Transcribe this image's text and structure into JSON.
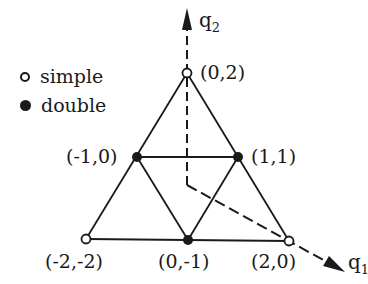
{
  "legend": {
    "items": [
      {
        "marker": "open-circle",
        "label": "simple"
      },
      {
        "marker": "filled-circle",
        "label": "double"
      }
    ]
  },
  "axes": {
    "q1": {
      "base": "q",
      "sub": "1"
    },
    "q2": {
      "base": "q",
      "sub": "2"
    }
  },
  "points": [
    {
      "id": "p02",
      "label": "(0,2)",
      "type": "simple",
      "x": 187,
      "y": 73
    },
    {
      "id": "pm10",
      "label": "(-1,0)",
      "type": "double",
      "x": 137,
      "y": 157
    },
    {
      "id": "p11",
      "label": "(1,1)",
      "type": "double",
      "x": 238,
      "y": 157
    },
    {
      "id": "pm2m2",
      "label": "(-2,-2)",
      "type": "simple",
      "x": 86,
      "y": 239
    },
    {
      "id": "p0m1",
      "label": "(0,-1)",
      "type": "double",
      "x": 188,
      "y": 240
    },
    {
      "id": "p20",
      "label": "(2,0)",
      "type": "simple",
      "x": 289,
      "y": 241
    }
  ],
  "colors": {
    "ink": "#1a1a1a",
    "background": "#ffffff"
  }
}
